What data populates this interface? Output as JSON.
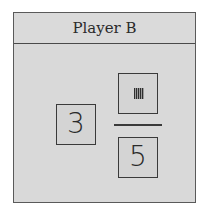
{
  "panel": {
    "title": "Player B"
  },
  "mixed_number": {
    "whole": "3",
    "numerator_icon": "striped-placeholder-icon",
    "denominator": "5"
  }
}
